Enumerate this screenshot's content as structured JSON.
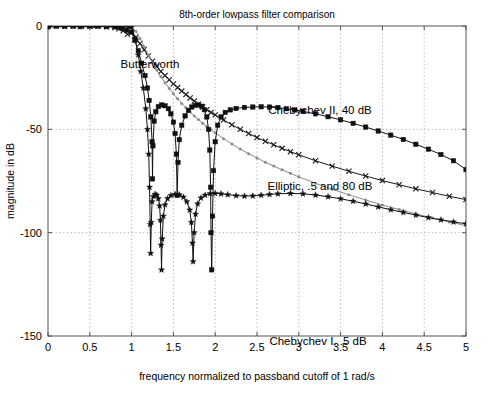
{
  "chart_data": {
    "type": "line",
    "title": "8th-order lowpass filter comparison",
    "xlabel": "frequency normalized to passband cutoff of 1 rad/s",
    "ylabel": "magnitude in dB",
    "xlim": [
      0,
      5
    ],
    "ylim": [
      -150,
      0
    ],
    "xticks": [
      "0",
      "0.5",
      "1",
      "1.5",
      "2",
      "2.5",
      "3",
      "3.5",
      "4",
      "4.5",
      "5"
    ],
    "xtick_values": [
      0,
      0.5,
      1,
      1.5,
      2,
      2.5,
      3,
      3.5,
      4,
      4.5,
      5
    ],
    "yticks": [
      "0",
      "-50",
      "-100",
      "-150"
    ],
    "ytick_values": [
      0,
      -50,
      -100,
      -150
    ],
    "grid": true,
    "legend_position": "inline-annotations",
    "annotations": [
      {
        "text": "Butterworth",
        "x": 1.18,
        "y": -14,
        "px": 150,
        "py": 68
      },
      {
        "text": "Chebychev II, 40 dB",
        "x": 2.72,
        "y": -33,
        "px": 320,
        "py": 114
      },
      {
        "text": "Elliptic, .5 and 80 dB",
        "x": 2.72,
        "y": -72,
        "px": 320,
        "py": 190
      },
      {
        "text": "Chebychev I, .5 dB",
        "x": 3.18,
        "y": -143,
        "px": 318,
        "py": 345
      }
    ],
    "series": [
      {
        "name": "Butterworth",
        "marker": "x",
        "color": "#1a1a1a",
        "points": [
          [
            0.0,
            0.0
          ],
          [
            0.1,
            0.0
          ],
          [
            0.2,
            0.0
          ],
          [
            0.3,
            0.0
          ],
          [
            0.4,
            0.0
          ],
          [
            0.5,
            -0.01
          ],
          [
            0.6,
            -0.05
          ],
          [
            0.7,
            -0.2
          ],
          [
            0.8,
            -0.7
          ],
          [
            0.85,
            -1.3
          ],
          [
            0.9,
            -2.3
          ],
          [
            0.95,
            -4.0
          ],
          [
            1.0,
            -3.0
          ],
          [
            1.05,
            -5.5
          ],
          [
            1.1,
            -8.5
          ],
          [
            1.15,
            -11.5
          ],
          [
            1.2,
            -14.5
          ],
          [
            1.25,
            -17.0
          ],
          [
            1.3,
            -19.5
          ],
          [
            1.35,
            -22.0
          ],
          [
            1.4,
            -24.0
          ],
          [
            1.45,
            -26.0
          ],
          [
            1.5,
            -28.0
          ],
          [
            1.55,
            -29.8
          ],
          [
            1.6,
            -31.5
          ],
          [
            1.65,
            -33.2
          ],
          [
            1.7,
            -34.8
          ],
          [
            1.75,
            -36.3
          ],
          [
            1.8,
            -37.8
          ],
          [
            1.85,
            -39.2
          ],
          [
            1.9,
            -40.5
          ],
          [
            1.95,
            -41.8
          ],
          [
            2.0,
            -43.0
          ],
          [
            2.1,
            -45.5
          ],
          [
            2.2,
            -47.8
          ],
          [
            2.3,
            -50.0
          ],
          [
            2.4,
            -52.0
          ],
          [
            2.5,
            -54.0
          ],
          [
            2.6,
            -55.8
          ],
          [
            2.7,
            -57.5
          ],
          [
            2.8,
            -59.2
          ],
          [
            2.9,
            -60.8
          ],
          [
            3.0,
            -62.3
          ],
          [
            3.2,
            -65.2
          ],
          [
            3.4,
            -67.8
          ],
          [
            3.6,
            -70.3
          ],
          [
            3.8,
            -72.6
          ],
          [
            4.0,
            -74.8
          ],
          [
            4.2,
            -76.8
          ],
          [
            4.4,
            -78.8
          ],
          [
            4.6,
            -80.6
          ],
          [
            4.8,
            -82.4
          ],
          [
            5.0,
            -84.0
          ]
        ]
      },
      {
        "name": "Chebychev I, .5 dB",
        "marker": "dot",
        "color": "#8a8a8a",
        "points": [
          [
            0.0,
            -0.5
          ],
          [
            0.15,
            -0.1
          ],
          [
            0.3,
            -0.4
          ],
          [
            0.45,
            -0.05
          ],
          [
            0.6,
            -0.45
          ],
          [
            0.75,
            -0.1
          ],
          [
            0.85,
            -0.4
          ],
          [
            0.92,
            -0.1
          ],
          [
            0.97,
            -0.35
          ],
          [
            1.0,
            -0.5
          ],
          [
            1.05,
            -2.5
          ],
          [
            1.1,
            -6.0
          ],
          [
            1.15,
            -10.0
          ],
          [
            1.2,
            -14.0
          ],
          [
            1.25,
            -17.8
          ],
          [
            1.3,
            -21.3
          ],
          [
            1.35,
            -24.5
          ],
          [
            1.4,
            -27.5
          ],
          [
            1.45,
            -30.2
          ],
          [
            1.5,
            -32.8
          ],
          [
            1.55,
            -35.2
          ],
          [
            1.6,
            -37.5
          ],
          [
            1.65,
            -39.6
          ],
          [
            1.7,
            -41.6
          ],
          [
            1.75,
            -43.5
          ],
          [
            1.8,
            -45.3
          ],
          [
            1.85,
            -47.0
          ],
          [
            1.9,
            -48.6
          ],
          [
            1.95,
            -50.2
          ],
          [
            2.0,
            -51.7
          ],
          [
            2.1,
            -54.5
          ],
          [
            2.2,
            -57.1
          ],
          [
            2.3,
            -59.5
          ],
          [
            2.4,
            -61.8
          ],
          [
            2.5,
            -63.9
          ],
          [
            2.6,
            -65.9
          ],
          [
            2.7,
            -67.8
          ],
          [
            2.8,
            -69.6
          ],
          [
            2.9,
            -71.3
          ],
          [
            3.0,
            -73.0
          ],
          [
            3.2,
            -76.1
          ],
          [
            3.4,
            -79.0
          ],
          [
            3.6,
            -81.7
          ],
          [
            3.8,
            -84.2
          ],
          [
            4.0,
            -86.6
          ],
          [
            4.2,
            -88.8
          ],
          [
            4.4,
            -90.9
          ],
          [
            4.6,
            -92.9
          ],
          [
            4.8,
            -94.8
          ],
          [
            5.0,
            -96.6
          ]
        ]
      },
      {
        "name": "Chebychev II, 40 dB",
        "marker": "square",
        "color": "#111111",
        "points": [
          [
            0.0,
            0.0
          ],
          [
            0.1,
            0.0
          ],
          [
            0.2,
            0.0
          ],
          [
            0.3,
            0.0
          ],
          [
            0.4,
            0.0
          ],
          [
            0.5,
            0.0
          ],
          [
            0.6,
            -0.02
          ],
          [
            0.7,
            -0.1
          ],
          [
            0.8,
            -0.4
          ],
          [
            0.88,
            -1.0
          ],
          [
            0.94,
            -2.0
          ],
          [
            1.0,
            -3.0
          ],
          [
            1.04,
            -7.0
          ],
          [
            1.08,
            -12.0
          ],
          [
            1.12,
            -18.0
          ],
          [
            1.16,
            -24.0
          ],
          [
            1.19,
            -30.0
          ],
          [
            1.21,
            -36.0
          ],
          [
            1.23,
            -44.0
          ],
          [
            1.245,
            -56.0
          ],
          [
            1.25,
            -74.0
          ],
          [
            1.255,
            -58.0
          ],
          [
            1.27,
            -46.0
          ],
          [
            1.29,
            -41.5
          ],
          [
            1.32,
            -39.0
          ],
          [
            1.36,
            -38.2
          ],
          [
            1.4,
            -38.6
          ],
          [
            1.44,
            -40.0
          ],
          [
            1.47,
            -42.5
          ],
          [
            1.5,
            -46.5
          ],
          [
            1.52,
            -52.0
          ],
          [
            1.535,
            -62.0
          ],
          [
            1.545,
            -82.0
          ],
          [
            1.555,
            -66.0
          ],
          [
            1.57,
            -55.0
          ],
          [
            1.6,
            -48.0
          ],
          [
            1.64,
            -43.5
          ],
          [
            1.68,
            -40.8
          ],
          [
            1.72,
            -39.2
          ],
          [
            1.76,
            -38.4
          ],
          [
            1.8,
            -38.2
          ],
          [
            1.84,
            -38.8
          ],
          [
            1.87,
            -40.5
          ],
          [
            1.9,
            -44.0
          ],
          [
            1.92,
            -50.0
          ],
          [
            1.935,
            -60.0
          ],
          [
            1.945,
            -78.0
          ],
          [
            1.95,
            -100.0
          ],
          [
            1.958,
            -118.0
          ],
          [
            1.968,
            -92.0
          ],
          [
            1.98,
            -70.0
          ],
          [
            2.0,
            -56.0
          ],
          [
            2.03,
            -48.0
          ],
          [
            2.07,
            -44.0
          ],
          [
            2.12,
            -41.8
          ],
          [
            2.18,
            -40.6
          ],
          [
            2.25,
            -39.9
          ],
          [
            2.35,
            -39.4
          ],
          [
            2.45,
            -39.2
          ],
          [
            2.55,
            -39.1
          ],
          [
            2.65,
            -39.2
          ],
          [
            2.75,
            -39.5
          ],
          [
            2.85,
            -40.0
          ],
          [
            2.95,
            -40.6
          ],
          [
            3.05,
            -41.3
          ],
          [
            3.2,
            -42.5
          ],
          [
            3.35,
            -43.9
          ],
          [
            3.5,
            -45.4
          ],
          [
            3.65,
            -47.1
          ],
          [
            3.8,
            -48.9
          ],
          [
            3.95,
            -50.8
          ],
          [
            4.1,
            -52.8
          ],
          [
            4.25,
            -54.9
          ],
          [
            4.4,
            -57.2
          ],
          [
            4.55,
            -59.6
          ],
          [
            4.7,
            -62.2
          ],
          [
            4.85,
            -65.2
          ],
          [
            5.0,
            -69.5
          ]
        ]
      },
      {
        "name": "Elliptic, .5 and 80 dB",
        "marker": "star",
        "color": "#111111",
        "points": [
          [
            0.0,
            -0.5
          ],
          [
            0.2,
            -0.1
          ],
          [
            0.38,
            -0.45
          ],
          [
            0.55,
            -0.08
          ],
          [
            0.7,
            -0.4
          ],
          [
            0.82,
            -0.12
          ],
          [
            0.9,
            -0.4
          ],
          [
            0.96,
            -0.15
          ],
          [
            1.0,
            -0.5
          ],
          [
            1.04,
            -6.0
          ],
          [
            1.08,
            -14.0
          ],
          [
            1.11,
            -22.0
          ],
          [
            1.14,
            -30.0
          ],
          [
            1.17,
            -40.0
          ],
          [
            1.19,
            -50.0
          ],
          [
            1.205,
            -62.0
          ],
          [
            1.215,
            -78.0
          ],
          [
            1.222,
            -96.0
          ],
          [
            1.228,
            -110.0
          ],
          [
            1.235,
            -95.0
          ],
          [
            1.245,
            -85.0
          ],
          [
            1.26,
            -82.5
          ],
          [
            1.28,
            -81.4
          ],
          [
            1.3,
            -81.8
          ],
          [
            1.32,
            -83.5
          ],
          [
            1.335,
            -87.0
          ],
          [
            1.345,
            -94.0
          ],
          [
            1.352,
            -106.0
          ],
          [
            1.358,
            -118.0
          ],
          [
            1.366,
            -103.0
          ],
          [
            1.38,
            -92.0
          ],
          [
            1.4,
            -86.5
          ],
          [
            1.43,
            -83.5
          ],
          [
            1.47,
            -82.0
          ],
          [
            1.52,
            -81.4
          ],
          [
            1.57,
            -81.6
          ],
          [
            1.62,
            -82.8
          ],
          [
            1.66,
            -85.0
          ],
          [
            1.695,
            -89.0
          ],
          [
            1.715,
            -95.0
          ],
          [
            1.728,
            -105.0
          ],
          [
            1.736,
            -114.0
          ],
          [
            1.748,
            -100.0
          ],
          [
            1.765,
            -91.0
          ],
          [
            1.79,
            -86.0
          ],
          [
            1.83,
            -83.2
          ],
          [
            1.88,
            -81.8
          ],
          [
            1.94,
            -81.1
          ],
          [
            2.0,
            -81.0
          ],
          [
            2.07,
            -81.2
          ],
          [
            2.15,
            -81.6
          ],
          [
            2.25,
            -82.1
          ],
          [
            2.35,
            -82.3
          ],
          [
            2.45,
            -82.2
          ],
          [
            2.55,
            -81.9
          ],
          [
            2.65,
            -81.5
          ],
          [
            2.75,
            -81.2
          ],
          [
            2.9,
            -81.0
          ],
          [
            3.05,
            -81.2
          ],
          [
            3.2,
            -81.8
          ],
          [
            3.35,
            -82.6
          ],
          [
            3.5,
            -83.6
          ],
          [
            3.65,
            -84.8
          ],
          [
            3.8,
            -86.1
          ],
          [
            3.95,
            -87.5
          ],
          [
            4.1,
            -88.9
          ],
          [
            4.25,
            -90.2
          ],
          [
            4.4,
            -91.5
          ],
          [
            4.55,
            -92.7
          ],
          [
            4.7,
            -93.8
          ],
          [
            4.85,
            -94.8
          ],
          [
            5.0,
            -95.7
          ]
        ]
      }
    ]
  },
  "plot_geometry": {
    "left": 48,
    "right": 466,
    "top": 26,
    "bottom": 336
  },
  "colors": {
    "axis": "#555555",
    "grid": "#9a9a9a",
    "background": "#ffffff"
  }
}
